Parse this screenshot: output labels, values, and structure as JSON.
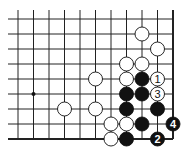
{
  "board": {
    "cols": 11,
    "rows": 9,
    "x0": 18,
    "dx": 15.5,
    "y0": 19,
    "dy": 15,
    "hoshi": [
      {
        "col": 1,
        "row": 5
      }
    ],
    "stones": [
      {
        "color": "white",
        "col": 8,
        "row": 1,
        "label": ""
      },
      {
        "color": "white",
        "col": 9,
        "row": 2,
        "label": ""
      },
      {
        "color": "white",
        "col": 7,
        "row": 3,
        "label": ""
      },
      {
        "color": "white",
        "col": 8,
        "row": 3,
        "label": ""
      },
      {
        "color": "white",
        "col": 5,
        "row": 4,
        "label": ""
      },
      {
        "color": "white",
        "col": 7,
        "row": 4,
        "label": ""
      },
      {
        "color": "black",
        "col": 8,
        "row": 4,
        "label": ""
      },
      {
        "color": "white",
        "col": 9,
        "row": 4,
        "label": "1"
      },
      {
        "color": "black",
        "col": 7,
        "row": 5,
        "label": ""
      },
      {
        "color": "black",
        "col": 8,
        "row": 5,
        "label": ""
      },
      {
        "color": "white",
        "col": 9,
        "row": 5,
        "label": "3"
      },
      {
        "color": "white",
        "col": 3,
        "row": 6,
        "label": ""
      },
      {
        "color": "white",
        "col": 5,
        "row": 6,
        "label": ""
      },
      {
        "color": "black",
        "col": 7,
        "row": 6,
        "label": ""
      },
      {
        "color": "black",
        "col": 9,
        "row": 6,
        "label": ""
      },
      {
        "color": "white",
        "col": 6,
        "row": 7,
        "label": ""
      },
      {
        "color": "white",
        "col": 7,
        "row": 7,
        "label": ""
      },
      {
        "color": "black",
        "col": 8,
        "row": 7,
        "label": ""
      },
      {
        "color": "black",
        "col": 10,
        "row": 7,
        "label": "4"
      },
      {
        "color": "white",
        "col": 6,
        "row": 8,
        "label": ""
      },
      {
        "color": "black",
        "col": 7,
        "row": 8,
        "label": ""
      },
      {
        "color": "black",
        "col": 9,
        "row": 8,
        "label": "2"
      }
    ]
  }
}
